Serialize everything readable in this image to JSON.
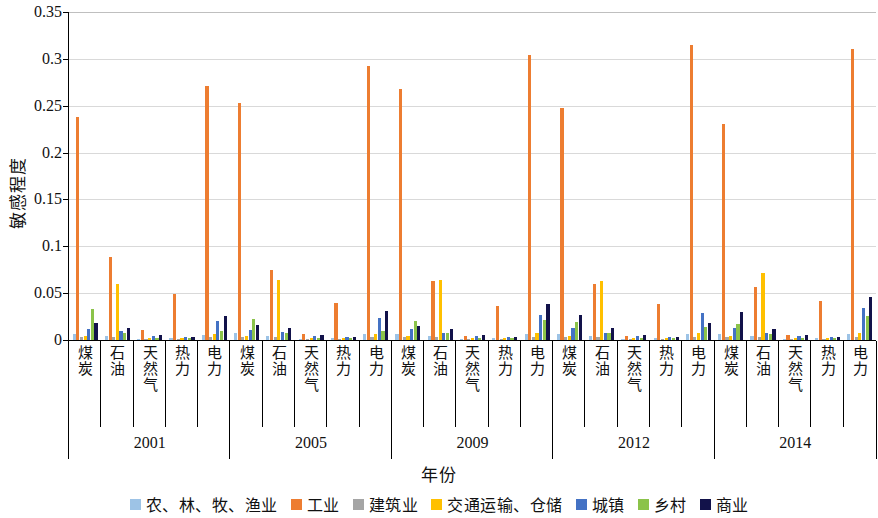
{
  "chart_data": {
    "type": "bar",
    "title": "",
    "xlabel": "年份",
    "ylabel": "敏感程度",
    "ylim": [
      0,
      0.35
    ],
    "yticks": [
      "0",
      "0.05",
      "0.1",
      "0.15",
      "0.2",
      "0.25",
      "0.3",
      "0.35"
    ],
    "ytick_values": [
      0,
      0.05,
      0.1,
      0.15,
      0.2,
      0.25,
      0.3,
      0.35
    ],
    "grid": true,
    "legend_position": "bottom",
    "years": [
      "2001",
      "2005",
      "2009",
      "2012",
      "2014"
    ],
    "energy_types": [
      "煤炭",
      "石油",
      "天然气",
      "热力",
      "电力"
    ],
    "categories": [
      "2001-煤炭",
      "2001-石油",
      "2001-天然气",
      "2001-热力",
      "2001-电力",
      "2005-煤炭",
      "2005-石油",
      "2005-天然气",
      "2005-热力",
      "2005-电力",
      "2009-煤炭",
      "2009-石油",
      "2009-天然气",
      "2009-热力",
      "2009-电力",
      "2012-煤炭",
      "2012-石油",
      "2012-天然气",
      "2012-热力",
      "2012-电力",
      "2014-煤炭",
      "2014-石油",
      "2014-天然气",
      "2014-热力",
      "2014-电力"
    ],
    "series": [
      {
        "name": "农、林、牧、渔业",
        "color": "#9DC3E6",
        "values": [
          0.006,
          0.004,
          0.001,
          0.002,
          0.005,
          0.007,
          0.004,
          0.001,
          0.002,
          0.006,
          0.006,
          0.004,
          0.001,
          0.002,
          0.006,
          0.006,
          0.004,
          0.001,
          0.002,
          0.006,
          0.006,
          0.004,
          0.001,
          0.002,
          0.006
        ]
      },
      {
        "name": "工业",
        "color": "#ED7D31",
        "values": [
          0.238,
          0.089,
          0.011,
          0.049,
          0.271,
          0.253,
          0.075,
          0.006,
          0.039,
          0.292,
          0.268,
          0.063,
          0.004,
          0.036,
          0.304,
          0.248,
          0.06,
          0.004,
          0.038,
          0.315,
          0.231,
          0.057,
          0.005,
          0.042,
          0.311
        ]
      },
      {
        "name": "建筑业",
        "color": "#A5A5A5",
        "values": [
          0.003,
          0.003,
          0.001,
          0.001,
          0.003,
          0.003,
          0.003,
          0.001,
          0.001,
          0.003,
          0.003,
          0.003,
          0.001,
          0.001,
          0.003,
          0.003,
          0.003,
          0.001,
          0.001,
          0.003,
          0.003,
          0.003,
          0.001,
          0.001,
          0.003
        ]
      },
      {
        "name": "交通运输、仓储",
        "color": "#FFC000",
        "values": [
          0.004,
          0.06,
          0.002,
          0.002,
          0.006,
          0.004,
          0.064,
          0.002,
          0.002,
          0.006,
          0.004,
          0.064,
          0.002,
          0.002,
          0.007,
          0.004,
          0.063,
          0.002,
          0.002,
          0.007,
          0.004,
          0.071,
          0.002,
          0.002,
          0.008
        ]
      },
      {
        "name": "城镇",
        "color": "#4472C4",
        "values": [
          0.012,
          0.01,
          0.004,
          0.003,
          0.02,
          0.011,
          0.009,
          0.004,
          0.003,
          0.023,
          0.012,
          0.008,
          0.004,
          0.003,
          0.027,
          0.013,
          0.008,
          0.004,
          0.003,
          0.029,
          0.013,
          0.008,
          0.004,
          0.003,
          0.034
        ]
      },
      {
        "name": "乡村",
        "color": "#8BC34A",
        "values": [
          0.033,
          0.007,
          0.002,
          0.002,
          0.01,
          0.022,
          0.007,
          0.002,
          0.002,
          0.01,
          0.02,
          0.007,
          0.002,
          0.002,
          0.021,
          0.019,
          0.007,
          0.002,
          0.002,
          0.014,
          0.017,
          0.006,
          0.002,
          0.002,
          0.026
        ]
      },
      {
        "name": "商业",
        "color": "#12124A",
        "values": [
          0.018,
          0.013,
          0.005,
          0.003,
          0.026,
          0.016,
          0.013,
          0.005,
          0.003,
          0.031,
          0.015,
          0.012,
          0.005,
          0.003,
          0.038,
          0.027,
          0.013,
          0.005,
          0.003,
          0.018,
          0.03,
          0.012,
          0.005,
          0.003,
          0.046
        ]
      }
    ]
  }
}
